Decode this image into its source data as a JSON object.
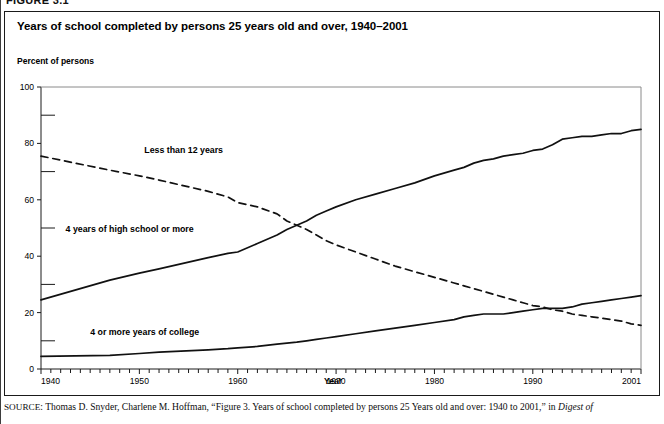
{
  "figure": {
    "number_label": "FIGURE 3.1",
    "title": "Years of school completed by persons 25 years old and over, 1940–2001"
  },
  "source": {
    "prefix": "SOURCE",
    "text_before_italic": ": Thomas D. Snyder, Charlene M. Hoffman, “Figure 3. Years of school completed by persons 25 Years old and over: 1940 to 2001,” in ",
    "italic_tail": "Digest of"
  },
  "chart_data": {
    "type": "line",
    "title": "Years of school completed by persons 25 years old and over, 1940–2001",
    "xlabel": "Year",
    "ylabel": "Percent of persons",
    "xlim": [
      1940,
      2001
    ],
    "ylim": [
      0,
      100
    ],
    "grid": false,
    "legend_position": "inline-annotations",
    "y_major_ticks": [
      0,
      20,
      40,
      60,
      80,
      100
    ],
    "y_minor_ticks": [
      10,
      30,
      50,
      70,
      90
    ],
    "y_tick_labels": [
      "0",
      "20",
      "40",
      "60",
      "80",
      "100"
    ],
    "x_tick_labels": [
      "1940",
      "1950",
      "1960",
      "1970",
      "1980",
      "1990",
      "2001"
    ],
    "x_labeled_years": [
      1940,
      1950,
      1960,
      1970,
      1980,
      1990,
      2001
    ],
    "x_minor_tick_interval": 1,
    "x": [
      1940,
      1947,
      1950,
      1952,
      1957,
      1959,
      1960,
      1962,
      1964,
      1965,
      1966,
      1967,
      1968,
      1969,
      1970,
      1972,
      1974,
      1976,
      1978,
      1980,
      1982,
      1983,
      1984,
      1985,
      1986,
      1987,
      1988,
      1989,
      1990,
      1991,
      1992,
      1993,
      1994,
      1995,
      1996,
      1997,
      1998,
      1999,
      2000,
      2001
    ],
    "series": [
      {
        "name": "Less than 12 years",
        "label": "Less than 12 years",
        "style": "dashed",
        "color": "#111111",
        "label_x": 1950.5,
        "label_y": 77.5,
        "values": [
          75.5,
          70.5,
          68.5,
          67.0,
          63.0,
          61.0,
          59.0,
          57.5,
          55.0,
          52.5,
          51.0,
          49.5,
          47.5,
          45.5,
          44.0,
          41.5,
          39.0,
          36.5,
          34.5,
          32.5,
          30.5,
          29.5,
          28.5,
          27.5,
          26.5,
          25.5,
          24.5,
          23.5,
          22.5,
          22.0,
          21.0,
          20.5,
          19.5,
          19.0,
          18.5,
          18.0,
          17.5,
          17.0,
          16.0,
          15.5
        ]
      },
      {
        "name": "4 years of high school or more",
        "label": "4 years of high school or more",
        "style": "solid",
        "color": "#111111",
        "label_x": 1942.5,
        "label_y": 49.5,
        "values": [
          24.5,
          31.5,
          34.0,
          35.5,
          39.5,
          41.0,
          41.5,
          44.5,
          47.5,
          49.5,
          51.0,
          52.5,
          54.5,
          56.0,
          57.5,
          60.0,
          62.0,
          64.0,
          66.0,
          68.5,
          70.5,
          71.5,
          73.0,
          74.0,
          74.5,
          75.5,
          76.0,
          76.5,
          77.5,
          78.0,
          79.5,
          81.5,
          82.0,
          82.5,
          82.5,
          83.0,
          83.5,
          83.5,
          84.5,
          85.0
        ]
      },
      {
        "name": "4 or more years of college",
        "label": "4 or more years of college",
        "style": "solid",
        "color": "#111111",
        "label_x": 1945.0,
        "label_y": 13.0,
        "values": [
          4.5,
          4.8,
          5.5,
          6.0,
          6.8,
          7.2,
          7.5,
          8.0,
          8.8,
          9.2,
          9.5,
          10.0,
          10.5,
          11.0,
          11.5,
          12.5,
          13.5,
          14.5,
          15.5,
          16.5,
          17.5,
          18.5,
          19.0,
          19.5,
          19.5,
          19.5,
          20.0,
          20.5,
          21.0,
          21.5,
          21.5,
          21.5,
          22.0,
          23.0,
          23.5,
          24.0,
          24.5,
          25.0,
          25.5,
          26.0
        ]
      }
    ]
  }
}
